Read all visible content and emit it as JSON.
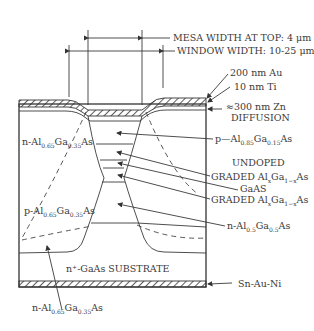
{
  "diagram": {
    "type": "semiconductor-cross-section",
    "dimensions": {
      "mesa_width": "MESA WIDTH AT TOP: 4 μm",
      "window_width": "WINDOW WIDTH: 10-25 μm"
    },
    "top_layers": {
      "au": "200 nm Au",
      "ti": "10 nm Ti",
      "zn_line1": "≈300 nm Zn",
      "zn_line2": "DIFFUSION"
    },
    "right_labels": {
      "p_cap": {
        "pre": "p—Al",
        "s1": "0.85",
        "mid": "Ga",
        "s2": "0.15",
        "post": "As"
      },
      "undoped": "UNDOPED",
      "graded1": {
        "pre": "GRADED Al",
        "s1": "x",
        "mid": "Ga",
        "s2": "1−x",
        "post": "As"
      },
      "gaas": "GaAS",
      "graded2": {
        "pre": "GRADED Al",
        "s1": "x",
        "mid": "Ga",
        "s2": "1−x",
        "post": "As"
      },
      "n_clad": {
        "pre": "n-Al",
        "s1": "0.5",
        "mid": "Ga",
        "s2": "0.5",
        "post": "As"
      }
    },
    "left_labels": {
      "n_region": {
        "pre": "n-Al",
        "s1": "0.65",
        "mid": "Ga",
        "s2": "0.35",
        "post": "As"
      },
      "p_region": {
        "pre": "p-Al",
        "s1": "0.65",
        "mid": "Ga",
        "s2": "0.35",
        "post": "As"
      }
    },
    "substrate": "n⁺-GaAs SUBSTRATE",
    "contact": "Sn-Au-Ni",
    "bottom_label": {
      "pre": "n-Al",
      "s1": "0.65",
      "mid": "Ga",
      "s2": "0.35",
      "post": "As"
    }
  }
}
